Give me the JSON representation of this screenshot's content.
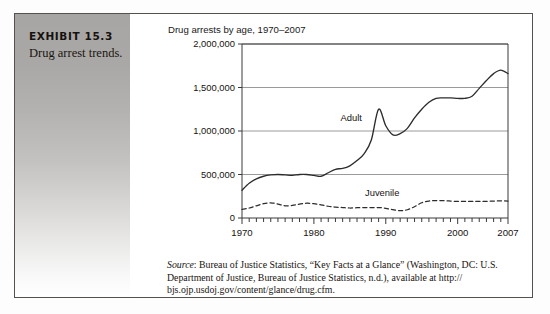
{
  "exhibit": {
    "title": "EXHIBIT 15.3",
    "subtitle": "Drug arrest trends."
  },
  "source": {
    "label": "Source",
    "text": ": Bureau of Justice Statistics, “Key Facts at a Glance” (Washington, DC: U.S. Department of Justice, Bureau of Justice Statistics, n.d.), available at http:// bjs.ojp.usdoj.gov/content/glance/drug.cfm."
  },
  "chart_data": {
    "type": "line",
    "title": "Drug arrests by age, 1970–2007",
    "xlabel": "",
    "ylabel": "",
    "xlim": [
      1970,
      2007
    ],
    "ylim": [
      0,
      2000000
    ],
    "grid": true,
    "grid_axis": "y",
    "legend": "inline-labels",
    "xticks": [
      1970,
      1980,
      1990,
      2000,
      2007
    ],
    "xtick_labels": [
      "1970",
      "1980",
      "1990",
      "2000",
      "2007"
    ],
    "minor_xtick_interval": 1,
    "yticks": [
      0,
      500000,
      1000000,
      1500000,
      2000000
    ],
    "ytick_labels": [
      "0",
      "500,000",
      "1,000,000",
      "1,500,000",
      "2,000,000"
    ],
    "annotations": [
      {
        "text": "Adult",
        "x": 1985.2,
        "y": 1120000
      },
      {
        "text": "Juvenile",
        "x": 1989.5,
        "y": 250000
      }
    ],
    "x": [
      1970,
      1971,
      1972,
      1973,
      1974,
      1975,
      1976,
      1977,
      1978,
      1979,
      1980,
      1981,
      1982,
      1983,
      1984,
      1985,
      1986,
      1987,
      1988,
      1989,
      1990,
      1991,
      1992,
      1993,
      1994,
      1995,
      1996,
      1997,
      1998,
      1999,
      2000,
      2001,
      2002,
      2003,
      2004,
      2005,
      2006,
      2007
    ],
    "series": [
      {
        "name": "Adult",
        "style": "solid",
        "color": "#2c2c2c",
        "values": [
          320000,
          400000,
          450000,
          480000,
          495000,
          500000,
          495000,
          490000,
          500000,
          500000,
          490000,
          480000,
          520000,
          560000,
          570000,
          600000,
          660000,
          740000,
          900000,
          1250000,
          1060000,
          955000,
          970000,
          1030000,
          1150000,
          1250000,
          1330000,
          1375000,
          1380000,
          1380000,
          1375000,
          1375000,
          1400000,
          1490000,
          1580000,
          1660000,
          1700000,
          1660000
        ]
      },
      {
        "name": "Juvenile",
        "style": "dashed",
        "color": "#2c2c2c",
        "values": [
          100000,
          115000,
          140000,
          165000,
          175000,
          160000,
          140000,
          145000,
          160000,
          170000,
          165000,
          150000,
          135000,
          125000,
          120000,
          115000,
          118000,
          120000,
          120000,
          120000,
          112000,
          95000,
          85000,
          95000,
          130000,
          175000,
          195000,
          200000,
          200000,
          195000,
          190000,
          190000,
          190000,
          190000,
          192000,
          195000,
          198000,
          195000
        ]
      }
    ]
  }
}
